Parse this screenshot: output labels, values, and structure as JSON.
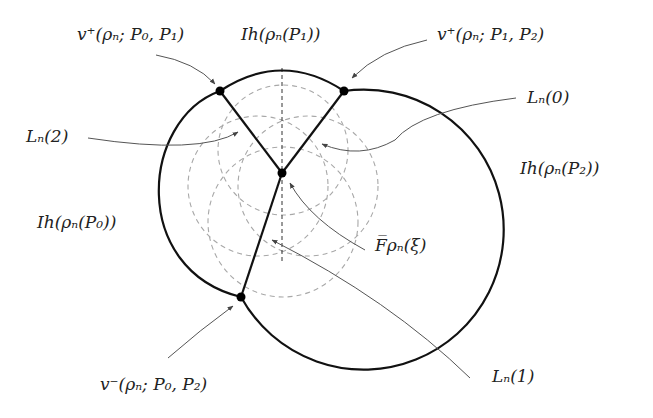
{
  "figure": {
    "type": "geometric-diagram",
    "labels": {
      "v_plus_P0P1": "v⁺(ρₙ; P₀, P₁)",
      "Ih_P1": "Ih(ρₙ(P₁))",
      "v_plus_P1P2": "v⁺(ρₙ; P₁, P₂)",
      "L2": "Lₙ(2)",
      "L0": "Lₙ(0)",
      "Ih_P2": "Ih(ρₙ(P₂))",
      "Ih_P0": "Ih(ρₙ(P₀))",
      "F": "F̅ρₙ(ξ)",
      "v_minus_P0P2": "v⁻(ρₙ; P₀, P₂)",
      "L1": "Lₙ(1)"
    },
    "points": {
      "v_plus_P0P1": [
        220,
        91
      ],
      "v_plus_P1P2": [
        344,
        91
      ],
      "F_center": [
        282,
        173
      ],
      "v_minus_P0P2": [
        241,
        297
      ]
    },
    "colors": {
      "stroke": "#111111",
      "dashed": "#a8a8a8",
      "leader": "#555555"
    }
  }
}
